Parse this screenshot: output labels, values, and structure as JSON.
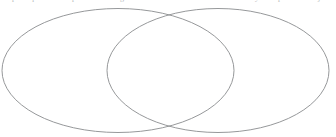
{
  "figure": {
    "type": "venn-diagram",
    "title": "",
    "caption": "",
    "width": 336,
    "height": 137,
    "background_color": "#ffffff",
    "stroke_color": "#8a8c8e",
    "stroke_width": 0.9,
    "fill": "none"
  },
  "chart_data": {
    "type": "diagram",
    "subtype": "venn",
    "title": "",
    "xlabel": "",
    "ylabel": "",
    "grid": false,
    "legend": "none",
    "sets": [
      {
        "id": "left-set",
        "label": "",
        "shape": "ellipse",
        "cx": 118,
        "cy": 70.5,
        "rx": 116,
        "ry": 62,
        "stroke": "#8a8c8e",
        "fill": "none"
      },
      {
        "id": "right-set",
        "label": "",
        "shape": "ellipse",
        "cx": 218,
        "cy": 70.5,
        "rx": 111,
        "ry": 62,
        "stroke": "#8a8c8e",
        "fill": "none"
      }
    ],
    "regions": [
      {
        "id": "left-only",
        "label": "",
        "value": null
      },
      {
        "id": "intersection",
        "label": "",
        "value": null
      },
      {
        "id": "right-only",
        "label": "",
        "value": null
      }
    ],
    "intersection_points": [
      {
        "x": 168,
        "y": 12
      },
      {
        "x": 168,
        "y": 125
      }
    ]
  },
  "clipped_text": {
    "description": "partial glyph remnants clipped by the top crop edge",
    "color": "#b9bbbd",
    "fragments": [
      {
        "text": "p",
        "x": 12
      },
      {
        "text": "q",
        "x": 30
      },
      {
        "text": "p",
        "x": 72
      },
      {
        "text": "g",
        "x": 120
      },
      {
        "text": "y",
        "x": 255
      },
      {
        "text": "p",
        "x": 278
      },
      {
        "text": "j",
        "x": 318
      }
    ]
  }
}
